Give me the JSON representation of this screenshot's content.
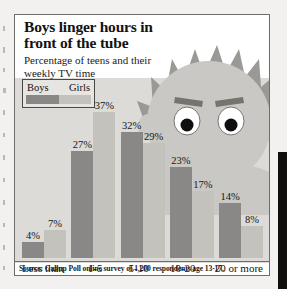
{
  "figure": {
    "title": "Boys linger hours in front of the tube",
    "subtitle": "Percentage of teens and their weekly TV time",
    "source": "Source: Gallup Poll online survey of 1,200 respondents age 13-17.",
    "illustration": "cartoon-boy-head-icon"
  },
  "legend": {
    "series": [
      {
        "label": "Boys",
        "color": "#8a8886"
      },
      {
        "label": "Girls",
        "color": "#c3c2bd"
      }
    ]
  },
  "chart_data": {
    "type": "bar",
    "title": "Boys linger hours in front of the tube",
    "subtitle": "Percentage of teens and their weekly TV time",
    "xlabel": "",
    "ylabel": "",
    "ylim": [
      0,
      40
    ],
    "grid": false,
    "legend_position": "top-left",
    "value_suffix": "%",
    "categories": [
      "Less than\n1 hour",
      "1-5\nhours",
      "5-10\nhours",
      "10-20\nhours",
      "20 or more\nhours"
    ],
    "series": [
      {
        "name": "Boys",
        "color": "#8a8886",
        "values": [
          4,
          27,
          32,
          23,
          14
        ]
      },
      {
        "name": "Girls",
        "color": "#c3c2bd",
        "values": [
          7,
          37,
          29,
          17,
          8
        ]
      }
    ],
    "data_labels": [
      [
        "4%",
        "7%"
      ],
      [
        "27%",
        "37%"
      ],
      [
        "32%",
        "29%"
      ],
      [
        "23%",
        "17%"
      ],
      [
        "14%",
        "8%"
      ]
    ],
    "annotation": "Source: Gallup Poll online survey of 1,200 respondents age 13-17."
  },
  "colors": {
    "panel": "#dcdbd7",
    "boys": "#8a8886",
    "girls": "#c3c2bd",
    "frame": "#6f6d6a",
    "text": "#131211",
    "hair": "#9b9996",
    "skin": "#c9c8c4"
  }
}
